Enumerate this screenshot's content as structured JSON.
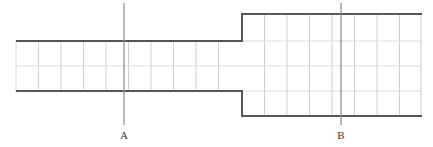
{
  "diagram": {
    "background_color": "#ffffff",
    "outline_color": "#585858",
    "grid_color": "#d0d0d0",
    "section_line_color": "#8a8a8a",
    "label_color": "#3a3a3a",
    "geometry": {
      "canvas": {
        "width": 433,
        "height": 147
      },
      "left_segment": {
        "name": "small-diameter-shaft",
        "x_start": 16,
        "x_end": 242,
        "top_y": 41,
        "bottom_y": 91,
        "height": 50
      },
      "right_segment": {
        "name": "large-diameter-shaft",
        "x_start": 242,
        "x_end": 422,
        "top_y": 14,
        "bottom_y": 116,
        "height": 102
      },
      "step_x": 242,
      "grid": {
        "vertical_spacing": 22.5,
        "left_vertical_x": [
          16,
          38.5,
          61,
          83.5,
          106,
          128.5,
          151,
          173.5,
          196,
          218.5,
          241
        ],
        "right_vertical_x": [
          242,
          264.5,
          287,
          309.5,
          332,
          354.5,
          377,
          399.5,
          422
        ],
        "left_horizontal_y": [
          66
        ],
        "right_horizontal_y": [
          41,
          66,
          91
        ]
      }
    },
    "section_lines": [
      {
        "id": "A",
        "label": "A",
        "x": 124,
        "y_top": 3,
        "y_bottom": 125,
        "label_x": 124,
        "label_y": 139
      },
      {
        "id": "B",
        "label": "B",
        "x": 341,
        "y_top": 3,
        "y_bottom": 125,
        "label_x": 341,
        "label_y": 139
      }
    ]
  }
}
